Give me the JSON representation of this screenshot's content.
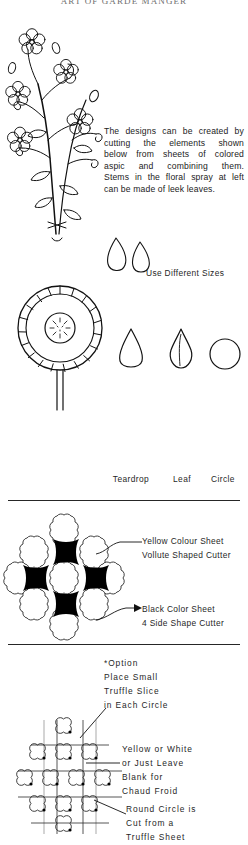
{
  "page": {
    "running_head": "ART OF GARDE MANGER",
    "width": 248,
    "height": 845,
    "ink_color": "#1a1a1a",
    "paper_color": "#ffffff"
  },
  "sections": {
    "floral_spray": {
      "figure_name": "floral-spray-illustration",
      "caption_lines": [
        "The designs can be created by",
        "cutting the elements shown",
        "below from sheets of colored",
        "aspic and combining them.",
        "Stems in the floral spray at left",
        "can be made of leek leaves."
      ]
    },
    "sizes": {
      "note": "Use Different Sizes",
      "small_teardrop_name": "small-teardrop-shape",
      "large_teardrop_name": "large-teardrop-shape"
    },
    "flower": {
      "figure_name": "daisy-flower-illustration"
    },
    "shapes": [
      {
        "label": "Teardrop",
        "icon": "teardrop-shape"
      },
      {
        "label": "Leaf",
        "icon": "leaf-shape"
      },
      {
        "label": "Circle",
        "icon": "circle-shape"
      }
    ],
    "volute_design": {
      "figure_name": "volute-cross-pattern",
      "callouts": [
        {
          "name": "yellow-colour-sheet-callout",
          "lines": [
            "Yellow Colour Sheet",
            "Vollute Shaped Cutter"
          ]
        },
        {
          "name": "black-color-sheet-callout",
          "lines": [
            "Black Color Sheet",
            "4 Side Shape Cutter"
          ]
        }
      ]
    },
    "truffle_design": {
      "figure_name": "scalloped-grid-pattern",
      "option_note": {
        "name": "option-note",
        "lines": [
          "*Option",
          "Place Small",
          "Truffle Slice",
          "in Each Circle"
        ]
      },
      "callouts": [
        {
          "name": "yellow-or-white-callout",
          "lines": [
            "Yellow or White",
            "or Just Leave",
            "Blank for",
            "Chaud Froid"
          ]
        },
        {
          "name": "round-circle-callout",
          "lines": [
            "Round Circle is",
            "Cut from a",
            "Truffle Sheet"
          ]
        }
      ]
    }
  }
}
